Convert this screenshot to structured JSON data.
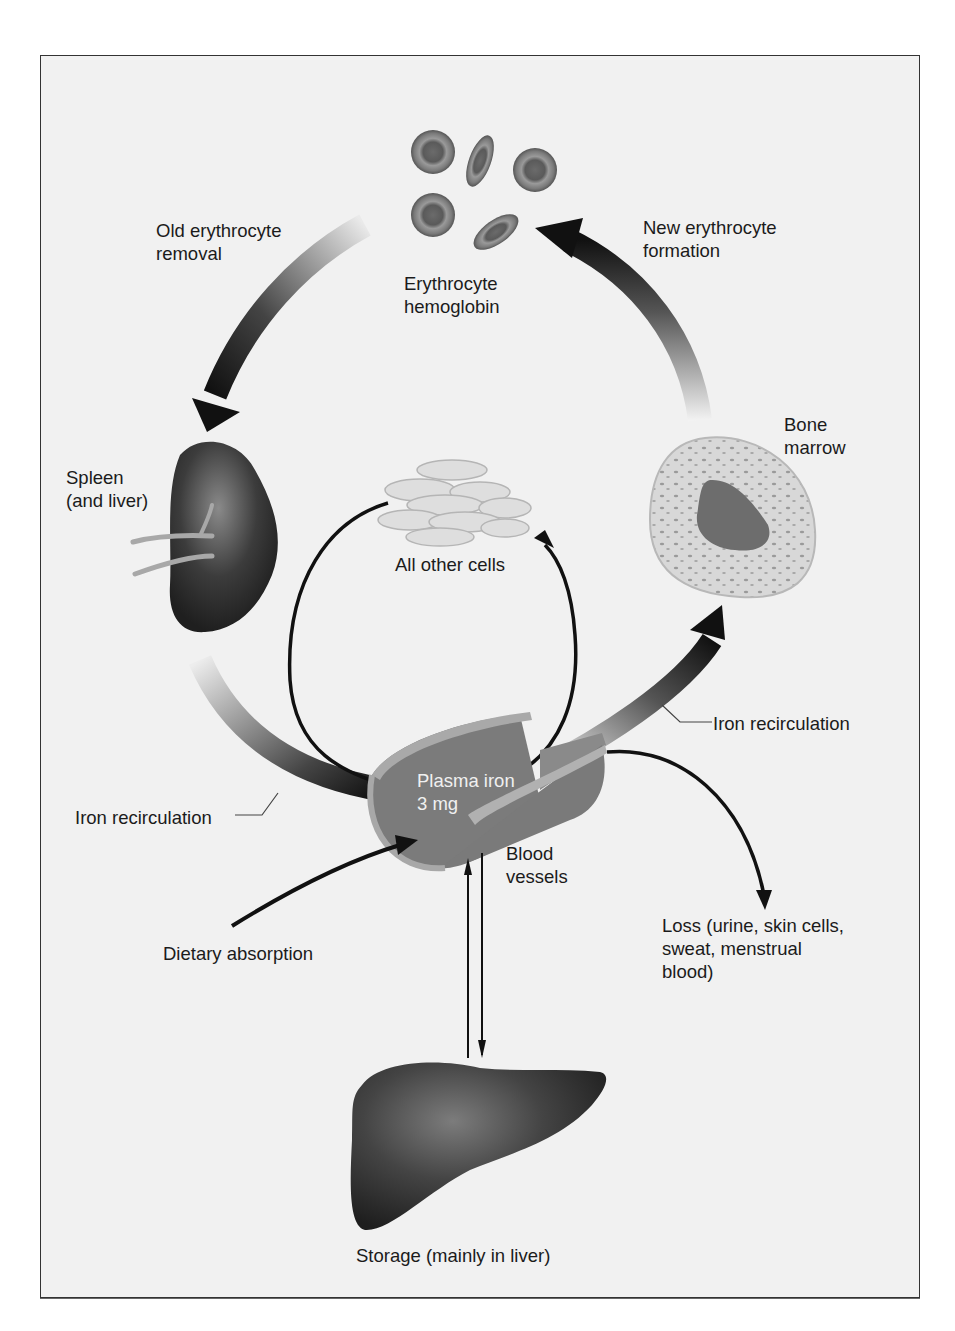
{
  "diagram": {
    "nodes": {
      "erythrocyte": {
        "label_line1": "Erythrocyte",
        "label_line2": "hemoglobin",
        "icon": "red-blood-cells"
      },
      "spleen": {
        "label_line1": "Spleen",
        "label_line2": "(and liver)",
        "icon": "spleen"
      },
      "bone_marrow": {
        "label_line1": "Bone",
        "label_line2": "marrow",
        "icon": "bone-marrow-cell"
      },
      "other_cells": {
        "label": "All other cells",
        "icon": "cell-cluster"
      },
      "plasma": {
        "label_line1": "Plasma iron",
        "label_line2": "3 mg",
        "icon": "blood-vessel"
      },
      "blood_vessels": {
        "label_line1": "Blood",
        "label_line2": "vessels"
      },
      "storage": {
        "label": "Storage (mainly in liver)",
        "icon": "liver"
      }
    },
    "flows": {
      "old_removal": {
        "label_line1": "Old erythrocyte",
        "label_line2": "removal"
      },
      "new_formation": {
        "label_line1": "New erythrocyte",
        "label_line2": "formation"
      },
      "recirc_left": {
        "label": "Iron recirculation"
      },
      "recirc_right": {
        "label": "Iron recirculation"
      },
      "dietary": {
        "label": "Dietary absorption"
      },
      "loss": {
        "label_line1": "Loss (urine, skin cells,",
        "label_line2": "sweat, menstrual",
        "label_line3": "blood)"
      }
    },
    "colors": {
      "background": "#f1f1f1",
      "frame_border": "#333333",
      "organ_dark": "#3a3a3a",
      "arrow_dark": "#111111",
      "vessel": "#7a7a7a",
      "vessel_rim": "#a9a9a9"
    }
  }
}
